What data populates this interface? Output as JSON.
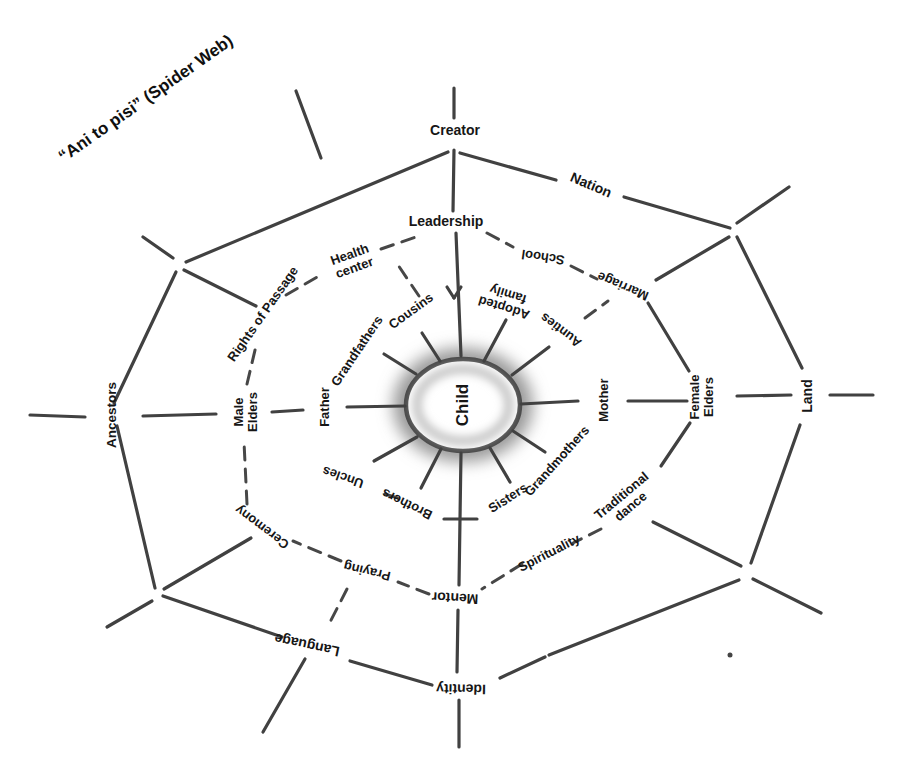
{
  "title": "“Ani to pisi” (Spider Web)",
  "center": {
    "label": "Child"
  },
  "rings": {
    "inner": {
      "father": "Father",
      "grandfathers": "Grandfathers",
      "cousins": "Cousins",
      "adopted_family": "Adopted family",
      "aunties": "Aunties",
      "mother": "Mother",
      "grandmothers": "Grandmothers",
      "sisters": "Sisters",
      "brothers": "Brothers",
      "uncles": "Uncles"
    },
    "middle": {
      "leadership": "Leadership",
      "school": "School",
      "marriage": "Marriage",
      "female_elders": "Female Elders",
      "traditional_dance": "Traditional dance",
      "spirituality": "Spirituality",
      "mentor": "Mentor",
      "praying": "Praying",
      "ceremony": "Ceremony",
      "male_elders": "Male Elders",
      "rights_of_passage": "Rights of Passage",
      "health_center": "Health center"
    },
    "outer": {
      "creator": "Creator",
      "nation": "Nation",
      "land": "Land",
      "identity": "Identity",
      "language": "Language",
      "ancestors": "Ancestors"
    }
  },
  "colors": {
    "background": "#ffffff",
    "line": "#414141",
    "dashed_line": "#474747",
    "text": "#161616",
    "center_halo": "#999999"
  }
}
